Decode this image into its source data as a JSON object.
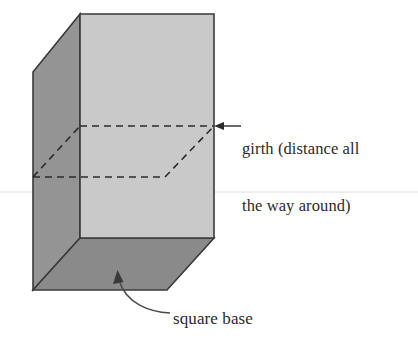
{
  "figure": {
    "kind": "geometry-diagram",
    "background_color": "#ffffff"
  },
  "labels": {
    "girth": {
      "line1": "girth (distance all",
      "line2": "the way around)",
      "full_text": "girth (distance all the way around)",
      "color": "#2b2b2b"
    },
    "base": {
      "text": "square base",
      "color": "#2b2b2b"
    }
  },
  "shape": {
    "name": "square-prism",
    "faces": {
      "front": {
        "name": "front-face",
        "fill": "#c9c9c9",
        "points": "80,14 214,14 214,238 80,238"
      },
      "left": {
        "name": "left-side-face",
        "fill": "#949494",
        "points": "33,72 80,14 80,238 33,290"
      },
      "bottom": {
        "name": "bottom-base-face",
        "fill": "#8a8a8a",
        "points": "33,290 80,238 214,238 167,290"
      }
    },
    "outline_color": "#3a3a3a",
    "outline_width": 1.6
  },
  "girth_path": {
    "name": "girth-dashed-outline",
    "stroke": "#2b2b2b",
    "dash": "7 5",
    "width": 1.6,
    "segments": [
      {
        "name": "girth-top-front",
        "d": "M 80 126 L 214 126"
      },
      {
        "name": "girth-right-rise",
        "d": "M 165 177 L 214 126"
      },
      {
        "name": "girth-bottom-front",
        "d": "M 33 177 L 165 177"
      },
      {
        "name": "girth-left-rise",
        "d": "M 33 177 L 80 126"
      }
    ]
  },
  "annotations": {
    "girth_arrow": {
      "name": "girth-arrow",
      "d": "M 241 126 L 219 126",
      "stroke": "#2b2b2b",
      "width": 1.4,
      "arrowhead": "214,126 223,122 223,130"
    },
    "base_arrow": {
      "name": "square-base-arrow",
      "d": "M 168 313 C 150 311 125 303 119 279",
      "stroke": "#4a4a4a",
      "width": 1.5,
      "arrowhead": "118,271 114,283 123,283"
    },
    "scan_line": {
      "name": "faint-scan-line",
      "y": 192,
      "color": "#ededed"
    }
  }
}
